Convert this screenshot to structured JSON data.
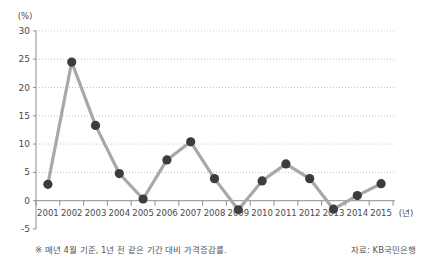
{
  "chart_data": {
    "type": "line",
    "title": "",
    "y_unit_label": "(%)",
    "x_unit_label": "(년)",
    "categories": [
      "2001",
      "2002",
      "2003",
      "2004",
      "2005",
      "2006",
      "2007",
      "2008",
      "2009",
      "2010",
      "2011",
      "2012",
      "2013",
      "2014",
      "2015"
    ],
    "values": [
      2.9,
      24.5,
      13.3,
      4.8,
      0.3,
      7.2,
      10.4,
      3.9,
      -1.6,
      3.5,
      6.5,
      3.9,
      -1.5,
      0.9,
      3.0
    ],
    "ylim": [
      -5,
      30
    ],
    "yticks": [
      30,
      25,
      20,
      15,
      10,
      5,
      0,
      -5
    ],
    "grid": "horizontal-dotted",
    "legend": "none"
  },
  "footnote": "※ 매년 4월 기준, 1년 전 같은 기간 대비 가격증감률.",
  "source": "자료: KB국민은행",
  "colors": {
    "line": "#a8a8a8",
    "marker": "#3c3c3c",
    "grid": "#c6c6c6",
    "axis": "#8f8f8f",
    "tick_text": "#4a4a4a",
    "note_text": "#555555",
    "background": "#ffffff"
  }
}
